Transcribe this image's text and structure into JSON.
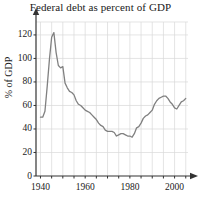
{
  "chart_data": {
    "type": "line",
    "title": "Federal debt as percent of GDP",
    "xlabel": "",
    "ylabel": "% of GDP",
    "xlim": [
      1938,
      2006
    ],
    "ylim": [
      0,
      131
    ],
    "grid": true,
    "grid_x_step": 5,
    "grid_y_step": 20,
    "legend": "none",
    "xticks": [
      1940,
      1960,
      1980,
      2000
    ],
    "xtick_labels": [
      "1940",
      "1960",
      "1980",
      "2000"
    ],
    "yticks": [
      0,
      20,
      40,
      60,
      80,
      100,
      120
    ],
    "ytick_labels": [
      "0",
      "20",
      "40",
      "60",
      "80",
      "100",
      "120"
    ],
    "line_color": "#808080",
    "grid_color": "#d8d8d8",
    "axis_color": "#333333",
    "series": [
      {
        "name": "Federal debt as percent of GDP",
        "x": [
          1940,
          1941,
          1942,
          1943,
          1944,
          1945,
          1946,
          1947,
          1948,
          1949,
          1950,
          1951,
          1952,
          1953,
          1954,
          1955,
          1956,
          1957,
          1958,
          1959,
          1960,
          1961,
          1962,
          1963,
          1964,
          1965,
          1966,
          1967,
          1968,
          1969,
          1970,
          1971,
          1972,
          1973,
          1974,
          1975,
          1976,
          1977,
          1978,
          1979,
          1980,
          1981,
          1982,
          1983,
          1984,
          1985,
          1986,
          1987,
          1988,
          1989,
          1990,
          1991,
          1992,
          1993,
          1994,
          1995,
          1996,
          1997,
          1998,
          1999,
          2000,
          2001,
          2002,
          2003,
          2004,
          2005
        ],
        "values": [
          50,
          50,
          55,
          76,
          99,
          118,
          122,
          105,
          94,
          92,
          93,
          79,
          75,
          72,
          71,
          69,
          64,
          61,
          60,
          58,
          56,
          55,
          54,
          52,
          50,
          48,
          45,
          43,
          42,
          39,
          38,
          38,
          38,
          37,
          34,
          35,
          36,
          36,
          35,
          34,
          34,
          33,
          36,
          41,
          42,
          45,
          49,
          51,
          52,
          54,
          56,
          61,
          64,
          66,
          67,
          68,
          68,
          66,
          63,
          61,
          58,
          57,
          60,
          63,
          64,
          66
        ]
      }
    ]
  }
}
